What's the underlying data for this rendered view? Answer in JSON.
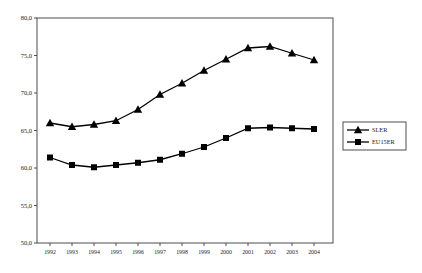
{
  "page": {
    "background": "#ffffff",
    "kind": "statistical line chart figure"
  },
  "colors": {
    "series": "#000000",
    "frame": "#3a3a3a",
    "tick_text": "#1a1a1a",
    "background": "#ffffff",
    "legend_border": "#3a3a3a"
  },
  "chart_data": {
    "type": "line",
    "title": "",
    "xlabel": "",
    "ylabel": "",
    "grid": false,
    "x": [
      1992,
      1993,
      1994,
      1995,
      1996,
      1997,
      1998,
      1999,
      2000,
      2001,
      2002,
      2003,
      2004
    ],
    "x_labels": [
      "1992",
      "1993",
      "1994",
      "1995",
      "1996",
      "1997",
      "1998",
      "1999",
      "2000",
      "2001",
      "2002",
      "2003",
      "2004"
    ],
    "ylim": [
      50,
      80
    ],
    "ytick_step": 5,
    "yticks": [
      50,
      55,
      60,
      65,
      70,
      75,
      80
    ],
    "ytick_labels": [
      "50,0",
      "55,0",
      "60,0",
      "65,0",
      "70,0",
      "75,0",
      "80,0"
    ],
    "series": [
      {
        "name": "SLER",
        "marker": "triangle",
        "color": "#000000",
        "values": [
          66.0,
          65.5,
          65.8,
          66.3,
          67.8,
          69.8,
          71.3,
          73.0,
          74.5,
          76.0,
          76.2,
          75.3,
          74.4
        ]
      },
      {
        "name": "EU15ER",
        "marker": "square",
        "color": "#000000",
        "values": [
          61.4,
          60.4,
          60.1,
          60.4,
          60.7,
          61.1,
          61.9,
          62.8,
          64.0,
          65.3,
          65.4,
          65.3,
          65.2
        ]
      }
    ],
    "legend": {
      "position": "right-outside",
      "entries": [
        {
          "label": "SLER",
          "marker": "triangle"
        },
        {
          "label": "EU15ER",
          "marker": "square"
        }
      ]
    }
  },
  "layout_values": {
    "plot": {
      "left": 37,
      "top": 18,
      "right": 333,
      "bottom": 243
    },
    "first_point_x": 50,
    "point_step_x": 22,
    "legend_box": {
      "x": 343,
      "y": 122,
      "width": 63,
      "height": 28
    }
  }
}
